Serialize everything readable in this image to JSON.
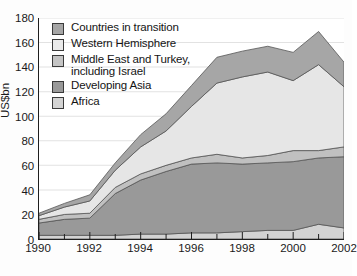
{
  "chart_data": {
    "type": "area",
    "stacked": true,
    "title": "",
    "xlabel": "",
    "ylabel": "US$bn",
    "ylim": [
      0,
      180
    ],
    "ytick_step": 20,
    "yticks": [
      0,
      20,
      40,
      60,
      80,
      100,
      120,
      140,
      160,
      180
    ],
    "xticks_major": [
      "1990",
      "1992",
      "1994",
      "1996",
      "1998",
      "2000",
      "2002"
    ],
    "x": [
      1990,
      1991,
      1992,
      1993,
      1994,
      1995,
      1996,
      1997,
      1998,
      1999,
      2000,
      2001,
      2002
    ],
    "grid": "horizontal",
    "legend_position": "upper-left-inside",
    "series": [
      {
        "name": "Africa",
        "color": "#d3d3d3",
        "stack_order": 1,
        "values": [
          3,
          3,
          3,
          3,
          4,
          4,
          5,
          5,
          6,
          7,
          7,
          12,
          9
        ]
      },
      {
        "name": "Developing Asia",
        "color": "#999999",
        "stack_order": 2,
        "values": [
          10,
          13,
          14,
          34,
          44,
          51,
          56,
          57,
          55,
          55,
          56,
          54,
          58
        ]
      },
      {
        "name": "Middle East and Turkey, including Israel",
        "color": "#c0c0c0",
        "stack_order": 3,
        "values": [
          3,
          4,
          4,
          5,
          5,
          5,
          5,
          7,
          5,
          6,
          9,
          6,
          8
        ]
      },
      {
        "name": "Western Hemisphere",
        "color": "#e6e6e6",
        "stack_order": 4,
        "values": [
          3,
          6,
          10,
          14,
          22,
          28,
          42,
          58,
          66,
          68,
          57,
          70,
          49
        ]
      },
      {
        "name": "Countries in transition",
        "color": "#a6a6a6",
        "stack_order": 5,
        "values": [
          2,
          3,
          5,
          6,
          10,
          14,
          17,
          21,
          21,
          21,
          23,
          27,
          20
        ]
      }
    ],
    "legend_entries": [
      {
        "label": "Countries in transition",
        "color": "#a6a6a6"
      },
      {
        "label": "Western Hemisphere",
        "color": "#e9e9e9"
      },
      {
        "label_line1": "Middle East and Turkey,",
        "label_line2": "including Israel",
        "color": "#c4c4c4"
      },
      {
        "label": "Developing Asia",
        "color": "#999999"
      },
      {
        "label": "Africa",
        "color": "#d3d3d3"
      }
    ]
  }
}
